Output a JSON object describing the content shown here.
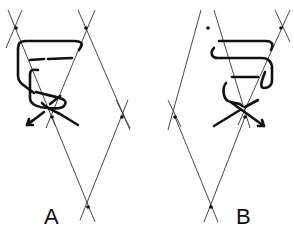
{
  "figure": {
    "panels": [
      {
        "id": "A",
        "label": "A"
      },
      {
        "id": "B",
        "label": "B"
      }
    ],
    "colors": {
      "line": "#333333",
      "strand": "#111111",
      "background": "#ffffff"
    }
  }
}
